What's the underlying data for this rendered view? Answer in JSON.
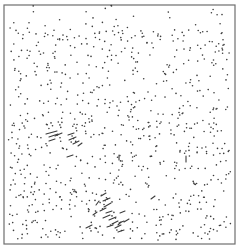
{
  "figure": {
    "width": 238,
    "height": 248,
    "frame": {
      "x": 4,
      "y": 5,
      "w": 231,
      "h": 239,
      "color": "#6e6e6e"
    },
    "dot_color": "#3c3c3c",
    "dot_radius": 0.8,
    "random_dots": {
      "count": 820,
      "seed": 20240611,
      "region": {
        "x0": 8,
        "y0": 14,
        "x1": 231,
        "y1": 240
      },
      "sparse_top_band": {
        "y0": 5,
        "y1": 28,
        "keep_fraction": 0.25
      }
    },
    "segments": [
      {
        "x1": 46,
        "y1": 134,
        "x2": 57,
        "y2": 131
      },
      {
        "x1": 49,
        "y1": 137,
        "x2": 58,
        "y2": 134
      },
      {
        "x1": 55,
        "y1": 136,
        "x2": 62,
        "y2": 133
      },
      {
        "x1": 49,
        "y1": 141,
        "x2": 55,
        "y2": 139
      },
      {
        "x1": 68,
        "y1": 135,
        "x2": 74,
        "y2": 133
      },
      {
        "x1": 69,
        "y1": 140,
        "x2": 76,
        "y2": 137
      },
      {
        "x1": 73,
        "y1": 144,
        "x2": 79,
        "y2": 141
      },
      {
        "x1": 78,
        "y1": 146,
        "x2": 82,
        "y2": 143
      },
      {
        "x1": 67,
        "y1": 157,
        "x2": 73,
        "y2": 155
      },
      {
        "x1": 101,
        "y1": 196,
        "x2": 106,
        "y2": 193
      },
      {
        "x1": 103,
        "y1": 201,
        "x2": 110,
        "y2": 198
      },
      {
        "x1": 104,
        "y1": 207,
        "x2": 111,
        "y2": 203
      },
      {
        "x1": 100,
        "y1": 211,
        "x2": 106,
        "y2": 208
      },
      {
        "x1": 106,
        "y1": 213,
        "x2": 112,
        "y2": 211
      },
      {
        "x1": 103,
        "y1": 218,
        "x2": 110,
        "y2": 215
      },
      {
        "x1": 109,
        "y1": 220,
        "x2": 116,
        "y2": 217
      },
      {
        "x1": 112,
        "y1": 224,
        "x2": 118,
        "y2": 221
      },
      {
        "x1": 107,
        "y1": 227,
        "x2": 113,
        "y2": 225
      },
      {
        "x1": 115,
        "y1": 228,
        "x2": 121,
        "y2": 225
      },
      {
        "x1": 118,
        "y1": 232,
        "x2": 124,
        "y2": 230
      },
      {
        "x1": 96,
        "y1": 205,
        "x2": 99,
        "y2": 201
      },
      {
        "x1": 93,
        "y1": 215,
        "x2": 97,
        "y2": 212
      },
      {
        "x1": 124,
        "y1": 222,
        "x2": 129,
        "y2": 219
      },
      {
        "x1": 120,
        "y1": 213,
        "x2": 125,
        "y2": 211
      },
      {
        "x1": 119,
        "y1": 223,
        "x2": 124,
        "y2": 221
      },
      {
        "x1": 86,
        "y1": 228,
        "x2": 92,
        "y2": 225
      },
      {
        "x1": 119,
        "y1": 155,
        "x2": 119,
        "y2": 160
      },
      {
        "x1": 186,
        "y1": 156,
        "x2": 186,
        "y2": 162
      },
      {
        "x1": 151,
        "y1": 199,
        "x2": 155,
        "y2": 196
      },
      {
        "x1": 118,
        "y1": 225,
        "x2": 121,
        "y2": 222
      }
    ]
  }
}
